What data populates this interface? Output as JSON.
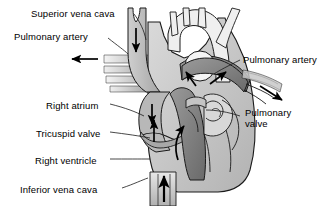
{
  "figure": {
    "background_color": "#ffffff",
    "text_color": "#000000",
    "outline_color": "#1a1a1a",
    "width": 329,
    "height": 206
  },
  "labels": [
    {
      "id": "superior-vena-cava",
      "text": "Superior vena cava",
      "x": 31,
      "y": 8,
      "lines": [
        "Superior vena cava"
      ]
    },
    {
      "id": "pulmonary-artery-left",
      "text": "Pulmonary artery",
      "x": 14,
      "y": 31,
      "lines": [
        "Pulmonary artery"
      ]
    },
    {
      "id": "pulmonary-artery-right",
      "text": "Pulmonary artery",
      "x": 243,
      "y": 54,
      "lines": [
        "Pulmonary artery"
      ]
    },
    {
      "id": "right-atrium",
      "text": "Right atrium",
      "x": 46,
      "y": 100,
      "lines": [
        "Right atrium"
      ]
    },
    {
      "id": "pulmonary-valve",
      "text": "Pulmonary valve",
      "x": 245,
      "y": 112,
      "lines": [
        "Pulmonary",
        "valve"
      ]
    },
    {
      "id": "tricuspid-valve",
      "text": "Tricuspid valve",
      "x": 36,
      "y": 128,
      "lines": [
        "Tricuspid valve"
      ]
    },
    {
      "id": "right-ventricle",
      "text": "Right ventricle",
      "x": 35,
      "y": 155,
      "lines": [
        "Right ventricle"
      ]
    },
    {
      "id": "inferior-vena-cava",
      "text": "Inferior vena cava",
      "x": 20,
      "y": 184,
      "lines": [
        "Inferior vena cava"
      ]
    }
  ],
  "colors": {
    "heart_body_light": "#d2d2d2",
    "heart_body_mid": "#b4b4b4",
    "chamber_dark": "#8c8c8c",
    "chamber_darker": "#6e6e6e",
    "vessel_light": "#e2e2e2",
    "vessel_white": "#f2f2f2",
    "outline": "#1a1a1a",
    "arrow": "#000000"
  },
  "flow_arrows": [
    {
      "id": "svc-down-arrow",
      "direction": "down",
      "region": "superior vena cava"
    },
    {
      "id": "pulmonary-artery-left-arrow",
      "direction": "left",
      "region": "left pulmonary artery"
    },
    {
      "id": "pulmonary-artery-right-arrow",
      "direction": "down-right",
      "region": "right pulmonary artery"
    },
    {
      "id": "right-atrium-arrow",
      "direction": "down",
      "region": "right atrium"
    },
    {
      "id": "tricuspid-arrow",
      "direction": "up",
      "region": "tricuspid valve"
    },
    {
      "id": "right-ventricle-arrow",
      "direction": "up",
      "region": "right ventricle outflow"
    },
    {
      "id": "ivc-up-arrow",
      "direction": "up",
      "region": "inferior vena cava"
    },
    {
      "id": "pulmonary-trunk-arrow-1",
      "direction": "up-left",
      "region": "pulmonary trunk"
    },
    {
      "id": "pulmonary-trunk-arrow-2",
      "direction": "up-right",
      "region": "pulmonary trunk"
    }
  ]
}
